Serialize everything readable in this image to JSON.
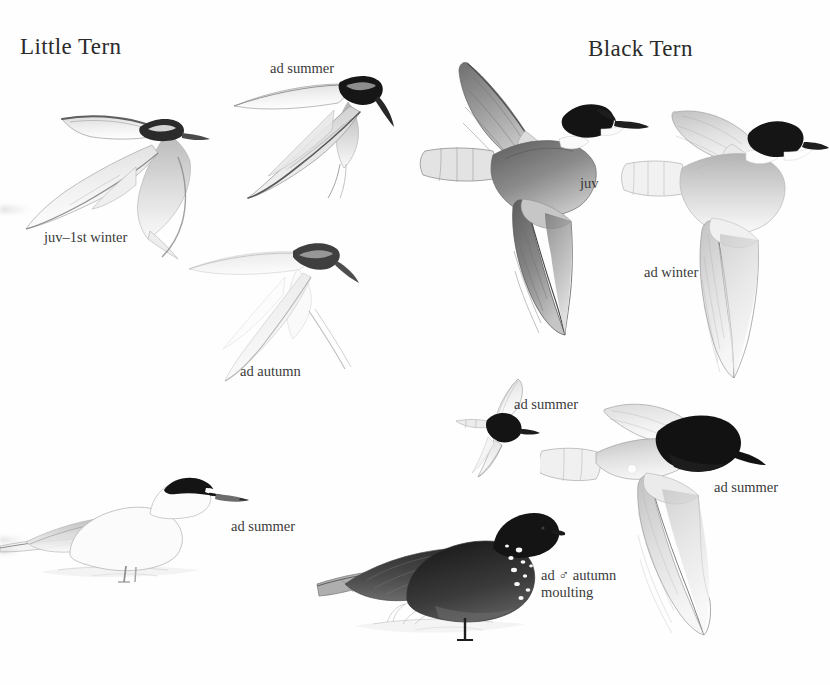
{
  "plate": {
    "width": 830,
    "height": 685,
    "background_color": "#fefefe",
    "ink_color": "#3a3a3a"
  },
  "species": [
    {
      "id": "little-tern",
      "title": "Little Tern"
    },
    {
      "id": "black-tern",
      "title": "Black Tern"
    }
  ],
  "titles": {
    "little_tern": "Little Tern",
    "black_tern": "Black Tern"
  },
  "captions": {
    "little_tern": {
      "ad_summer_flight": "ad summer",
      "juv_first_winter": "juv–1st winter",
      "ad_autumn": "ad autumn",
      "ad_summer_standing": "ad summer"
    },
    "black_tern": {
      "juv": "juv",
      "ad_winter": "ad winter",
      "ad_summer_small": "ad summer",
      "ad_summer_large": "ad summer",
      "ad_male_autumn_moulting_line1": "ad ♂ autumn",
      "ad_male_autumn_moulting_line2": "moulting"
    }
  },
  "figures": [
    {
      "name": "little-tern-juvenile-first-winter-in-flight",
      "species": "Little Tern",
      "plumage": "juv–1st winter",
      "pose": "flight, upperside, banking",
      "tone": "very pale, dark leading edge to outer wing"
    },
    {
      "name": "little-tern-adult-summer-in-flight",
      "species": "Little Tern",
      "plumage": "ad summer",
      "pose": "flight, diving, wings swept",
      "tone": "white with black cap and dark outer primaries"
    },
    {
      "name": "little-tern-adult-autumn-in-flight",
      "species": "Little Tern",
      "plumage": "ad autumn",
      "pose": "flight, underside, gliding",
      "tone": "very pale, faint ghosted rendering"
    },
    {
      "name": "little-tern-adult-summer-standing",
      "species": "Little Tern",
      "plumage": "ad summer",
      "pose": "standing on sand",
      "tone": "white body, black cap with white forehead blaze, yellow-toned bill"
    },
    {
      "name": "black-tern-juvenile-in-flight",
      "species": "Black Tern",
      "plumage": "juv",
      "pose": "flight, upperside, banking",
      "tone": "grey upperwings with dark cap and white collar"
    },
    {
      "name": "black-tern-adult-winter-in-flight",
      "species": "Black Tern",
      "plumage": "ad winter",
      "pose": "flight, upperside",
      "tone": "pale grey with black half-hood and white underparts"
    },
    {
      "name": "black-tern-adult-summer-small-head-on",
      "species": "Black Tern",
      "plumage": "ad summer",
      "pose": "flight, head-on",
      "tone": "black body, pale grey wings"
    },
    {
      "name": "black-tern-adult-summer-in-flight",
      "species": "Black Tern",
      "plumage": "ad summer",
      "pose": "flight, upperside, banking",
      "tone": "black head and body, grey wings"
    },
    {
      "name": "black-tern-adult-male-autumn-moulting-standing",
      "species": "Black Tern",
      "plumage": "ad ♂ autumn moulting",
      "pose": "standing on ground",
      "tone": "dark grey-black body with white moult flecking on breast and neck"
    }
  ],
  "palette": {
    "paper": "#fefefe",
    "text": "#3a3a3a",
    "black": "#1a1a1a",
    "dark_grey": "#4a4a4a",
    "mid_grey": "#8d8d8d",
    "light_grey": "#c9c9c9",
    "pale_grey": "#e6e6e6"
  }
}
